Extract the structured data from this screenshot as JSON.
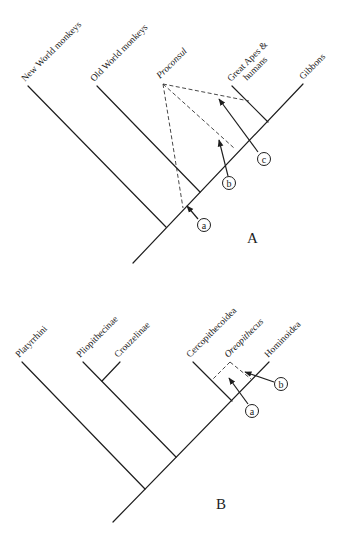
{
  "panels": [
    {
      "id": "A",
      "label": "A",
      "taxa": [
        {
          "name": "New World monkeys",
          "italic": false
        },
        {
          "name": "Old World monkeys",
          "italic": false
        },
        {
          "name": "Proconsul",
          "italic": true
        },
        {
          "name": "Great Apes &",
          "italic": false,
          "line2": "humans"
        },
        {
          "name": "Gibbons",
          "italic": false
        }
      ],
      "markers": [
        "a",
        "b",
        "c"
      ]
    },
    {
      "id": "B",
      "label": "B",
      "taxa": [
        {
          "name": "Platyrrhini",
          "italic": false
        },
        {
          "name": "Pliopithecinae",
          "italic": false
        },
        {
          "name": "Crouzelinae",
          "italic": false
        },
        {
          "name": "Cercopithecoidea",
          "italic": false
        },
        {
          "name": "Oreopithecus",
          "italic": true
        },
        {
          "name": "Hominoidea",
          "italic": false
        }
      ],
      "markers": [
        "a",
        "b"
      ]
    }
  ],
  "colors": {
    "line": "#1e1e1e",
    "background": "#ffffff"
  }
}
